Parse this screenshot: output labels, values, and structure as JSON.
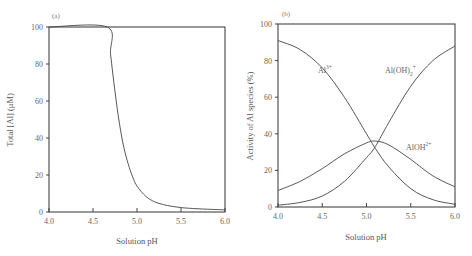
{
  "chart_data": [
    {
      "type": "line",
      "panel": "(a)",
      "title": "",
      "xlabel": "Solution pH",
      "ylabel": "Total [Al] (μM)",
      "xlim": [
        4.0,
        6.0
      ],
      "ylim": [
        0,
        100
      ],
      "xticks": [
        "4.0",
        "4.5",
        "5.0",
        "5.5",
        "6.0"
      ],
      "yticks": [
        "0",
        "20",
        "40",
        "60",
        "80",
        "100"
      ],
      "grid": false,
      "series": [
        {
          "name": "Total Al",
          "x": [
            4.0,
            4.66,
            4.7,
            4.75,
            4.8,
            4.85,
            4.9,
            4.95,
            5.0,
            5.1,
            5.2,
            5.3,
            5.4,
            5.5,
            5.6,
            5.8,
            6.0
          ],
          "y": [
            100,
            100,
            85,
            65,
            48,
            35,
            26,
            19,
            14,
            8.5,
            5.5,
            4,
            3,
            2.4,
            2,
            1.5,
            1.2
          ]
        }
      ]
    },
    {
      "type": "line",
      "panel": "(b)",
      "title": "",
      "xlabel": "Solution pH",
      "ylabel": "Activity of Al species (%)",
      "xlim": [
        4.0,
        6.0
      ],
      "ylim": [
        0,
        100
      ],
      "xticks": [
        "4.0",
        "4.5",
        "5.0",
        "5.5",
        "6.0"
      ],
      "yticks": [
        "0",
        "20",
        "40",
        "60",
        "80",
        "100"
      ],
      "grid": false,
      "series": [
        {
          "name": "Al3+",
          "label": "Al",
          "label_sup": "3+",
          "x": [
            4.0,
            4.25,
            4.5,
            4.75,
            5.0,
            5.1,
            5.25,
            5.5,
            5.75,
            6.0
          ],
          "y": [
            91,
            86,
            76,
            60,
            40,
            32,
            22,
            10,
            4,
            1.5
          ]
        },
        {
          "name": "Al(OH)2+",
          "label": "Al(OH)",
          "label_sub": "2",
          "label_sup": "+",
          "x": [
            4.0,
            4.25,
            4.5,
            4.75,
            5.0,
            5.1,
            5.25,
            5.5,
            5.75,
            6.0
          ],
          "y": [
            1,
            2.5,
            6,
            14,
            27,
            33,
            46,
            66,
            80,
            88
          ]
        },
        {
          "name": "AlOH2+",
          "label": "AlOH",
          "label_sup": "2+",
          "x": [
            4.0,
            4.25,
            4.5,
            4.75,
            5.0,
            5.1,
            5.25,
            5.5,
            5.75,
            6.0
          ],
          "y": [
            9,
            14,
            21,
            29,
            35,
            36,
            34,
            26,
            17,
            11
          ]
        }
      ]
    }
  ]
}
